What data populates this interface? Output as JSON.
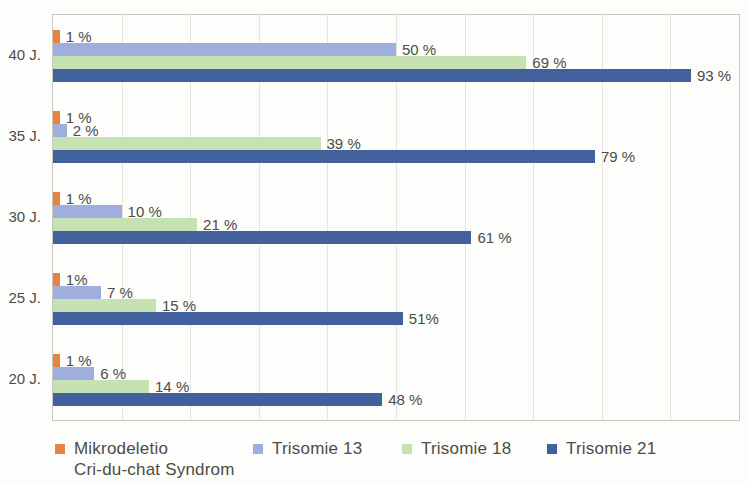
{
  "chart_data": {
    "type": "bar",
    "orientation": "horizontal",
    "title": "",
    "xlabel": "",
    "ylabel": "",
    "xlim": [
      0,
      100
    ],
    "grid": {
      "vertical": true,
      "interval_pct": 10
    },
    "legend_position": "bottom",
    "categories": [
      "40 J.",
      "35 J.",
      "30 J.",
      "25 J.",
      "20 J."
    ],
    "series": [
      {
        "name": "Mikrodeletio Cri-du-chat Syndrom",
        "color": "#E8823D",
        "values": [
          1,
          1,
          1,
          1,
          1
        ],
        "value_labels": [
          "1 %",
          "1 %",
          "1 %",
          "1%",
          "1 %"
        ]
      },
      {
        "name": "Trisomie 13",
        "color": "#9FAEDC",
        "values": [
          50,
          2,
          10,
          7,
          6
        ],
        "value_labels": [
          "50 %",
          "2 %",
          "10 %",
          "7 %",
          "6 %"
        ]
      },
      {
        "name": "Trisomie 18",
        "color": "#C6E1B2",
        "values": [
          69,
          39,
          21,
          15,
          14
        ],
        "value_labels": [
          "69 %",
          "39 %",
          "21 %",
          "15 %",
          "14 %"
        ]
      },
      {
        "name": "Trisomie 21",
        "color": "#42619C",
        "values": [
          93,
          79,
          61,
          51,
          48
        ],
        "value_labels": [
          "93 %",
          "79 %",
          "61 %",
          "51%",
          "48 %"
        ]
      }
    ],
    "legend": {
      "entries": [
        {
          "lines": [
            "Mikrodeletio",
            "Cri-du-chat Syndrom"
          ],
          "color": "#E8823D"
        },
        {
          "lines": [
            "Trisomie 13"
          ],
          "color": "#9FAEDC"
        },
        {
          "lines": [
            "Trisomie 18"
          ],
          "color": "#C6E1B2"
        },
        {
          "lines": [
            "Trisomie 21"
          ],
          "color": "#42619C"
        }
      ]
    }
  },
  "colors": {
    "text": "#4c4c48",
    "gridline": "#e6e6e1",
    "plot_border": "#c8c8c2",
    "background": "#fdfdfb"
  }
}
